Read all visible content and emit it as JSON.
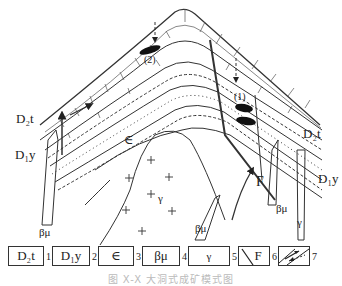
{
  "figure": {
    "labels": {
      "d2t_left": "D₂t",
      "d2t_right": "D₂t",
      "d1y_left": "D₁y",
      "d1y_right": "D₁y",
      "cambrian": "∈",
      "granite": "γ",
      "diabase_center": "βμ",
      "diabase_right": "βμ",
      "diabase_left": "βμ",
      "granite_dike": "γ",
      "fault": "F",
      "orebody_1": "(1)",
      "orebody_2": "(2)"
    },
    "legend": [
      {
        "symbol": "D₂t",
        "number": "1"
      },
      {
        "symbol": "D₁y",
        "number": "2"
      },
      {
        "symbol": "∈",
        "number": "3"
      },
      {
        "symbol": "βμ",
        "number": "4"
      },
      {
        "symbol": "γ",
        "number": "5"
      },
      {
        "symbol": "F",
        "number": "6",
        "icon": "fault-icon"
      },
      {
        "symbol": "",
        "number": "7",
        "icon": "ore-fluid-arrows-icon"
      }
    ],
    "caption": "图 X-X 大洞式成矿模式图"
  }
}
